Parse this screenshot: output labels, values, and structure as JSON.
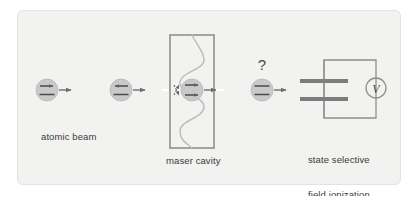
{
  "figure": {
    "domain": "diagram",
    "background_color": "#f2f2f0",
    "frame_border_color": "#e2e2e0",
    "ink_color": "#888888",
    "text_color": "#3a3a3a",
    "atom_fill_color": "#c9c9c9",
    "atom_stroke_color": "#b0b0b0",
    "plate_color": "#7d7d7d",
    "wave_color": "#b9b9b9"
  },
  "captions": {
    "atomic_beam": "atomic beam",
    "maser_cavity": "maser cavity",
    "state_selective_line1": "state selective",
    "state_selective_line2": "field ionization"
  },
  "annotations": {
    "question_mark": "?",
    "voltmeter_label": "V"
  },
  "atoms": [
    {
      "id": "atom-1",
      "name": "excited-atom-before-cavity-1",
      "cx": 47,
      "cy": 90,
      "r": 11,
      "upper_level_arrow": "right",
      "lower_level_arrow": "none",
      "trailing_arrow": true
    },
    {
      "id": "atom-2",
      "name": "excited-atom-before-cavity-2",
      "cx": 121,
      "cy": 90,
      "r": 11,
      "upper_level_arrow": "left",
      "lower_level_arrow": "none",
      "trailing_arrow": true
    },
    {
      "id": "atom-3",
      "name": "atom-inside-cavity",
      "cx": 192,
      "cy": 90,
      "r": 11,
      "upper_level_arrow": "right",
      "lower_level_arrow": "right",
      "trailing_arrow": true
    },
    {
      "id": "atom-4",
      "name": "atom-after-cavity-unknown-state",
      "cx": 262,
      "cy": 90,
      "r": 11,
      "upper_level_arrow": "none",
      "lower_level_arrow": "none",
      "trailing_arrow": true
    }
  ],
  "cavity": {
    "x": 170,
    "y": 35,
    "width": 44,
    "height": 113,
    "wave_cycles": 3,
    "wave_amplitude": 9
  },
  "detector": {
    "plate_upper": {
      "x": 300,
      "y": 79,
      "width": 48,
      "height": 4
    },
    "plate_lower": {
      "x": 300,
      "y": 97,
      "width": 48,
      "height": 4
    },
    "circuit_box": {
      "x": 324,
      "y": 60,
      "width": 52,
      "height": 58
    },
    "voltmeter": {
      "cx": 376,
      "cy": 88,
      "r": 10
    }
  }
}
